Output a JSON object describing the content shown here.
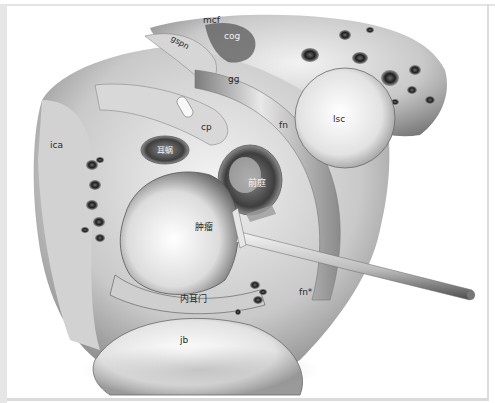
{
  "figure": {
    "labels": {
      "mcf": "mcf",
      "cog": "cog",
      "gspn": "gspn",
      "gg": "gg",
      "cp": "cp",
      "fn": "fn",
      "lsc": "lsc",
      "ica": "ica",
      "cochlea": "耳蜗",
      "vestibule": "前庭",
      "tumor": "肿瘤",
      "iam": "内耳门",
      "fn_star": "fn*",
      "jb": "jb"
    },
    "colors": {
      "background": "#ffffff",
      "frame": "#e2e2e2",
      "bone_light": "#e8e8e8",
      "bone_mid": "#b8b8b8",
      "bone_dark": "#3a3a3a",
      "label_dark": "#2a2a2a",
      "label_light": "#f4f4f4"
    }
  }
}
